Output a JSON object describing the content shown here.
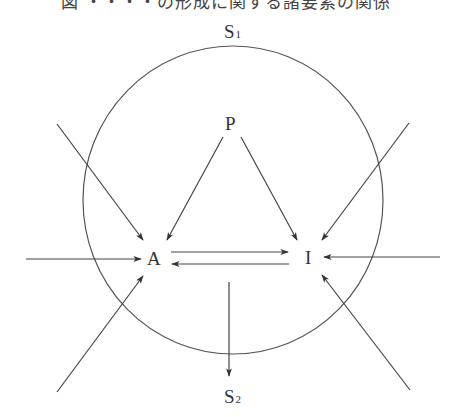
{
  "title": "図 ・・・・の形成に関する諸要素の関係",
  "nodes": {
    "S1": {
      "label": "S",
      "subscript": "1"
    },
    "P": {
      "label": "P"
    },
    "A": {
      "label": "A"
    },
    "I": {
      "label": "I"
    },
    "S2": {
      "label": "S",
      "subscript": "2"
    }
  },
  "edges": [
    {
      "from": "outside",
      "to": "A",
      "direction": "upper-left"
    },
    {
      "from": "outside",
      "to": "A",
      "direction": "left"
    },
    {
      "from": "outside",
      "to": "A",
      "direction": "lower-left"
    },
    {
      "from": "outside",
      "to": "I",
      "direction": "upper-right"
    },
    {
      "from": "outside",
      "to": "I",
      "direction": "right"
    },
    {
      "from": "outside",
      "to": "I",
      "direction": "lower-right"
    },
    {
      "from": "P",
      "to": "A"
    },
    {
      "from": "P",
      "to": "I"
    },
    {
      "from": "A",
      "to": "I"
    },
    {
      "from": "I",
      "to": "A"
    },
    {
      "from": "center",
      "to": "S2"
    }
  ],
  "colors": {
    "line": "#444444",
    "text": "#333333",
    "background": "#ffffff"
  }
}
